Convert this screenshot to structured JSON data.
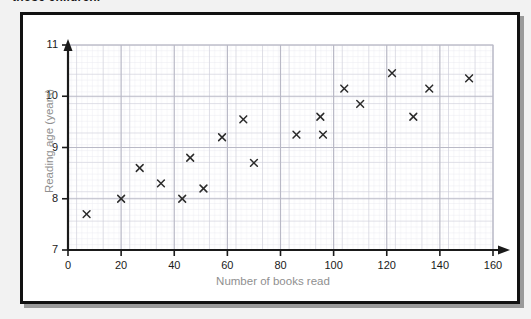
{
  "caption": {
    "text": "those children."
  },
  "figure": {
    "background_color": "#ffffff",
    "border_color": "#111111",
    "grid_minor_color": "#e6e6ef",
    "grid_major_color": "#c9c9d4",
    "axis_color": "#1a1a1a",
    "label_color": "#8f8f8f",
    "marker_color": "#2b2b2b"
  },
  "chart_data": {
    "type": "scatter",
    "title": "",
    "xlabel": "Number of books read",
    "ylabel": "Reading age (years)",
    "xlim": [
      0,
      160
    ],
    "ylim": [
      7,
      11
    ],
    "xticks": [
      0,
      20,
      40,
      60,
      80,
      100,
      120,
      140,
      160
    ],
    "yticks": [
      7,
      8,
      9,
      10,
      11
    ],
    "xtick_labels": [
      "0",
      "20",
      "40",
      "60",
      "80",
      "100",
      "120",
      "140",
      "160"
    ],
    "ytick_labels": [
      "7",
      "8",
      "9",
      "10",
      "11"
    ],
    "grid": true,
    "grid_style": "graph-paper",
    "legend": false,
    "marker": "x",
    "points": [
      {
        "x": 7,
        "y": 7.7
      },
      {
        "x": 20,
        "y": 8.0
      },
      {
        "x": 27,
        "y": 8.6
      },
      {
        "x": 35,
        "y": 8.3
      },
      {
        "x": 43,
        "y": 8.0
      },
      {
        "x": 46,
        "y": 8.8
      },
      {
        "x": 51,
        "y": 8.2
      },
      {
        "x": 58,
        "y": 9.2
      },
      {
        "x": 66,
        "y": 9.55
      },
      {
        "x": 70,
        "y": 8.7
      },
      {
        "x": 86,
        "y": 9.25
      },
      {
        "x": 95,
        "y": 9.6
      },
      {
        "x": 96,
        "y": 9.25
      },
      {
        "x": 104,
        "y": 10.15
      },
      {
        "x": 110,
        "y": 9.85
      },
      {
        "x": 122,
        "y": 10.45
      },
      {
        "x": 130,
        "y": 9.6
      },
      {
        "x": 136,
        "y": 10.15
      },
      {
        "x": 151,
        "y": 10.35
      }
    ]
  }
}
